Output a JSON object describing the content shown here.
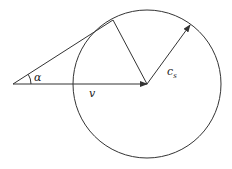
{
  "diagram": {
    "labels": {
      "alpha": "α",
      "v": "v",
      "cs": "c",
      "cs_sub": "s"
    },
    "colors": {
      "stroke": "#333333",
      "background": "#ffffff"
    }
  }
}
